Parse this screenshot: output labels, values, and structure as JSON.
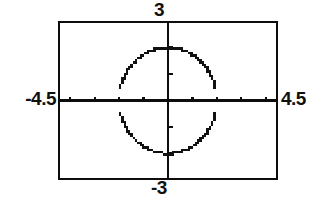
{
  "app": {
    "title": "Graphing Calculator Viewing Window",
    "screen_type": "function-plot"
  },
  "window_labels": {
    "xmin": "-4.5",
    "xmax": "4.5",
    "ymax": "3",
    "ymin": "-3"
  },
  "colors": {
    "ink": "#0d0d0d",
    "background": "#ffffff",
    "curve": "#111111"
  },
  "chart_data": {
    "type": "scatter",
    "title": "",
    "xlabel": "",
    "ylabel": "",
    "xlim": [
      -4.5,
      4.5
    ],
    "ylim": [
      -3,
      3
    ],
    "grid": false,
    "legend_position": "none",
    "axes": {
      "x_axis_at_y": 0,
      "y_axis_at_x": 0,
      "x_tick_interval": 1,
      "y_tick_interval": 1,
      "x_ticks": [
        -4,
        -3,
        -2,
        -1,
        1,
        2,
        3,
        4
      ],
      "y_ticks": [
        -2,
        -1,
        1,
        2
      ],
      "tick_length_px": 4
    },
    "annotations": [
      {
        "text": "3",
        "position": "top-center-outside",
        "value": 3
      },
      {
        "text": "-3",
        "position": "bottom-center-outside",
        "value": -3
      },
      {
        "text": "-4.5",
        "position": "left-middle-outside",
        "value": -4.5
      },
      {
        "text": "4.5",
        "position": "right-middle-outside",
        "value": 4.5
      }
    ],
    "series": [
      {
        "name": "upper-semicircle",
        "equation": "y = sqrt(4 - x^2)",
        "center": [
          0,
          0
        ],
        "radius": 2,
        "branch": "upper",
        "style": "dotted-pixelated",
        "x_domain": [
          -2,
          2
        ]
      },
      {
        "name": "lower-semicircle",
        "equation": "y = -sqrt(4 - x^2)",
        "center": [
          0,
          0
        ],
        "radius": 2,
        "branch": "lower",
        "style": "dotted-pixelated",
        "x_domain": [
          -2,
          2
        ]
      }
    ],
    "described_shape": {
      "kind": "circle",
      "center_x": 0,
      "center_y": 0,
      "radius": 2,
      "equation": "x^2 + y^2 = 4"
    }
  }
}
